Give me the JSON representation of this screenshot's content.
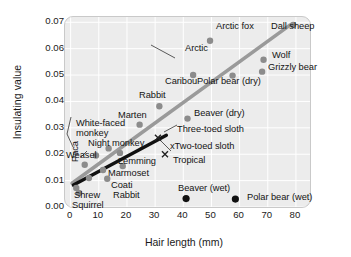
{
  "chart_data": {
    "type": "scatter",
    "title": "",
    "xlabel": "Hair length (mm)",
    "ylabel": "Insulating value",
    "xlim": [
      -2,
      85
    ],
    "ylim": [
      0.0,
      0.072
    ],
    "xticks": [
      0,
      10,
      20,
      30,
      40,
      50,
      60,
      70,
      80
    ],
    "xticklabels": [
      "0",
      "10",
      "20",
      "30",
      "40",
      "50",
      "60",
      "70",
      "80"
    ],
    "yticks": [
      0.0,
      0.01,
      0.02,
      0.03,
      0.04,
      0.05,
      0.06,
      0.07
    ],
    "yticklabels": [
      "0.00",
      "0.01",
      "0.02",
      "0.03",
      "0.04",
      "0.05",
      "0.06",
      "0.07"
    ],
    "grid": true,
    "grid_color": "#ffffff",
    "panel_color": "#ececec",
    "legend": null,
    "series": [
      {
        "name": "dry fur",
        "marker": "circle",
        "color": "#8c8c8c",
        "points": [
          {
            "label": "Shrew",
            "x": 2.0,
            "y": 0.0072
          },
          {
            "label": "Squirrel",
            "x": 3.0,
            "y": 0.0053
          },
          {
            "label": "Paca",
            "x": 6.5,
            "y": 0.011
          },
          {
            "label": "Weasel",
            "x": 5.0,
            "y": 0.016
          },
          {
            "label": "Marmoset",
            "x": 11.5,
            "y": 0.014
          },
          {
            "label": "Coati",
            "x": 13.0,
            "y": 0.0107
          },
          {
            "label": "Rabbit (small)",
            "x": 18.5,
            "y": 0.0155
          },
          {
            "label": "Lemming",
            "x": 17.5,
            "y": 0.0205
          },
          {
            "label": "Night monkey",
            "x": 13.5,
            "y": 0.0222
          },
          {
            "label": "White-faced monkey",
            "x": 9.0,
            "y": 0.0195
          },
          {
            "label": "Marten",
            "x": 24.5,
            "y": 0.0312
          },
          {
            "label": "Rabbit",
            "x": 31.5,
            "y": 0.0382
          },
          {
            "label": "Beaver (dry)",
            "x": 41.5,
            "y": 0.0335
          },
          {
            "label": "Caribou",
            "x": 43.5,
            "y": 0.05
          },
          {
            "label": "Arctic fox",
            "x": 49.5,
            "y": 0.063
          },
          {
            "label": "Polar bear (dry)",
            "x": 57.5,
            "y": 0.0498
          },
          {
            "label": "Grizzly bear",
            "x": 68.0,
            "y": 0.0513
          },
          {
            "label": "Wolf",
            "x": 68.5,
            "y": 0.0558
          },
          {
            "label": "Dall sheep",
            "x": 79.0,
            "y": 0.069
          }
        ]
      },
      {
        "name": "wet fur",
        "marker": "circle",
        "color": "#111111",
        "points": [
          {
            "label": "Beaver (wet)",
            "x": 41.0,
            "y": 0.0032
          },
          {
            "label": "Polar bear (wet)",
            "x": 58.5,
            "y": 0.003
          }
        ]
      },
      {
        "name": "sloths",
        "marker": "x",
        "color": "#222222",
        "points": [
          {
            "label": "Three-toed sloth",
            "x": 31.0,
            "y": 0.0262
          },
          {
            "label": "Two-toed sloth",
            "x": 33.5,
            "y": 0.02
          }
        ]
      }
    ],
    "trendlines": [
      {
        "name": "Arctic",
        "color": "#9a9a9a",
        "width": 3.6,
        "x0": 0.5,
        "y0": 0.009,
        "x1": 78.0,
        "y1": 0.069
      },
      {
        "name": "Tropical",
        "color": "#111111",
        "width": 3.4,
        "x0": 1.0,
        "y0": 0.0083,
        "x1": 34.0,
        "y1": 0.0272
      }
    ],
    "annotations": [
      {
        "label": "Arctic",
        "type": "line-callout"
      },
      {
        "label": "Tropical",
        "type": "line-callout"
      }
    ],
    "point_labels": [
      {
        "text": "Arctic fox",
        "x": 216,
        "y": 21,
        "style": "plain"
      },
      {
        "text": "Dall sheep",
        "x": 271,
        "y": 21,
        "style": "plain"
      },
      {
        "text": "Arctic",
        "x": 185,
        "y": 43,
        "style": "plain"
      },
      {
        "text": "Wolf",
        "x": 272,
        "y": 50,
        "style": "plain"
      },
      {
        "text": "Grizzly bear",
        "x": 268,
        "y": 62,
        "style": "plain"
      },
      {
        "text": "Caribou",
        "x": 165,
        "y": 76,
        "style": "plain"
      },
      {
        "text": "Polar bear (dry)",
        "x": 197,
        "y": 76,
        "style": "plain"
      },
      {
        "text": "Rabbit",
        "x": 139,
        "y": 90,
        "style": "plain"
      },
      {
        "text": "Beaver (dry)",
        "x": 194,
        "y": 108,
        "style": "plain"
      },
      {
        "text": "Marten",
        "x": 118,
        "y": 110,
        "style": "plain"
      },
      {
        "text": "Three-toed sloth",
        "x": 177,
        "y": 124,
        "style": "plain"
      },
      {
        "text": "White-faced monkey",
        "x": 76,
        "y": 118,
        "style": "wrap"
      },
      {
        "text": "Night monkey",
        "x": 88,
        "y": 138,
        "style": "plain"
      },
      {
        "text": "xTwo-toed sloth",
        "x": 170,
        "y": 141,
        "style": "plain"
      },
      {
        "text": "Weasel",
        "x": 66,
        "y": 150,
        "style": "plain"
      },
      {
        "text": "Lemming",
        "x": 118,
        "y": 156,
        "style": "plain"
      },
      {
        "text": "Tropical",
        "x": 173,
        "y": 155,
        "style": "plain"
      },
      {
        "text": "Paca",
        "x": 70,
        "y": 162,
        "style": "vert"
      },
      {
        "text": "Marmoset",
        "x": 108,
        "y": 168,
        "style": "plain"
      },
      {
        "text": "Coati",
        "x": 111,
        "y": 180,
        "style": "plain"
      },
      {
        "text": "Shrew",
        "x": 74,
        "y": 190,
        "style": "plain"
      },
      {
        "text": "Rabbit",
        "x": 113,
        "y": 190,
        "style": "plain"
      },
      {
        "text": "Squirrel",
        "x": 72,
        "y": 200,
        "style": "plain"
      },
      {
        "text": "Beaver (wet)",
        "x": 178,
        "y": 183,
        "style": "plain"
      },
      {
        "text": "Polar bear (wet)",
        "x": 247,
        "y": 192,
        "style": "plain"
      }
    ]
  }
}
